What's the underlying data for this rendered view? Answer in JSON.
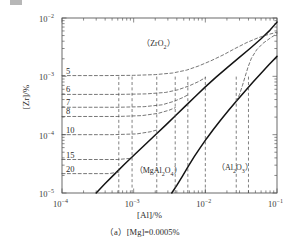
{
  "figure": {
    "caption_prefix": "（a）",
    "caption_text": "[Mg]=0.0005%",
    "caption_full": "（a）[Mg]=0.0005%"
  },
  "chart_data": {
    "type": "line",
    "title": "",
    "xlabel": "[Al]/%",
    "ylabel": "[Zr]/%",
    "xscale": "log",
    "yscale": "log",
    "xlim": [
      0.0001,
      0.1
    ],
    "ylim": [
      1e-05,
      0.01
    ],
    "grid": false,
    "legend_position": "none",
    "xticklabels": [
      "10-4",
      "10-3",
      "10-2",
      "10-1"
    ],
    "xtickvalues": [
      0.0001,
      0.001,
      0.01,
      0.1
    ],
    "yticklabels": [
      "10-2",
      "10-3",
      "10-4",
      "10-5"
    ],
    "ytickvalues": [
      0.01,
      0.001,
      0.0001,
      1e-05
    ],
    "annotations": [
      {
        "name": "region-zro2",
        "text": "（ZrO2）",
        "x": 0.0022,
        "y": 0.0035
      },
      {
        "name": "region-mgal2o4",
        "text": "（MgAl2O4）",
        "x": 0.0022,
        "y": 2.25e-05
      },
      {
        "name": "region-al2o3",
        "text": "（Al2O3）",
        "x": 0.026,
        "y": 2.55e-05
      }
    ],
    "contour_labels": [
      {
        "label": "5",
        "y": 0.00103
      },
      {
        "label": "6",
        "y": 0.00049
      },
      {
        "label": "7",
        "y": 0.000295
      },
      {
        "label": "8",
        "y": 0.000205
      },
      {
        "label": "10",
        "y": 0.0001
      },
      {
        "label": "15",
        "y": 3.75e-05
      },
      {
        "label": "20",
        "y": 2.15e-05
      }
    ],
    "series": [
      {
        "name": "ZrO2 / MgAl2O4 boundary (solid)",
        "style": "solid",
        "points": [
          [
            0.0003,
            1e-05
          ],
          [
            0.0004,
            1.45e-05
          ],
          [
            0.00055,
            2.15e-05
          ],
          [
            0.00075,
            3.15e-05
          ],
          [
            0.00105,
            4.65e-05
          ],
          [
            0.00145,
            6.8e-05
          ],
          [
            0.002,
            9.9e-05
          ],
          [
            0.0028,
            0.000146
          ],
          [
            0.00385,
            0.000213
          ],
          [
            0.0053,
            0.000312
          ],
          [
            0.0073,
            0.000455
          ],
          [
            0.01,
            0.00066
          ],
          [
            0.014,
            0.00096
          ],
          [
            0.02,
            0.0014
          ],
          [
            0.029,
            0.00205
          ],
          [
            0.042,
            0.003
          ],
          [
            0.06,
            0.0044
          ],
          [
            0.08,
            0.0062
          ],
          [
            0.1,
            0.0085
          ]
        ]
      },
      {
        "name": "MgAl2O4 / Al2O3 boundary (solid)",
        "style": "solid",
        "points": [
          [
            0.0034,
            1e-05
          ],
          [
            0.004,
            1.35e-05
          ],
          [
            0.0048,
            1.95e-05
          ],
          [
            0.0058,
            2.9e-05
          ],
          [
            0.007,
            4.2e-05
          ],
          [
            0.0085,
            6e-05
          ],
          [
            0.0105,
            8.7e-05
          ],
          [
            0.013,
            0.000124
          ],
          [
            0.0165,
            0.00018
          ],
          [
            0.021,
            0.00026
          ],
          [
            0.027,
            0.000375
          ],
          [
            0.035,
            0.00054
          ],
          [
            0.046,
            0.00079
          ],
          [
            0.06,
            0.00113
          ],
          [
            0.077,
            0.00158
          ],
          [
            0.1,
            0.0022
          ]
        ]
      },
      {
        "name": "contour-5",
        "style": "dashed",
        "points": [
          [
            0.0001,
            0.00103
          ],
          [
            0.0004,
            0.00103
          ],
          [
            0.001,
            0.00104
          ],
          [
            0.002,
            0.00107
          ],
          [
            0.0035,
            0.00114
          ],
          [
            0.0055,
            0.00128
          ],
          [
            0.008,
            0.0015
          ],
          [
            0.012,
            0.00185
          ],
          [
            0.018,
            0.00235
          ],
          [
            0.026,
            0.003
          ],
          [
            0.038,
            0.0038
          ],
          [
            0.055,
            0.0046
          ],
          [
            0.075,
            0.0052
          ],
          [
            0.1,
            0.0057
          ]
        ]
      },
      {
        "name": "contour-6",
        "style": "dashed",
        "points": [
          [
            0.0001,
            0.00049
          ],
          [
            0.0006,
            0.00049
          ],
          [
            0.0015,
            0.0005
          ],
          [
            0.0028,
            0.00053
          ],
          [
            0.0042,
            0.00059
          ],
          [
            0.006,
            0.00069
          ],
          [
            0.008,
            0.00081
          ],
          [
            0.01,
            0.00095
          ]
        ]
      },
      {
        "name": "contour-7",
        "style": "dashed",
        "points": [
          [
            0.0001,
            0.000295
          ],
          [
            0.0006,
            0.000295
          ],
          [
            0.0014,
            0.000302
          ],
          [
            0.0025,
            0.000325
          ],
          [
            0.0037,
            0.000375
          ],
          [
            0.0048,
            0.00043
          ],
          [
            0.0057,
            0.00048
          ]
        ]
      },
      {
        "name": "contour-8",
        "style": "dashed",
        "points": [
          [
            0.0001,
            0.000205
          ],
          [
            0.0006,
            0.000205
          ],
          [
            0.0013,
            0.000212
          ],
          [
            0.0022,
            0.000232
          ],
          [
            0.0031,
            0.000262
          ],
          [
            0.0038,
            0.00029
          ]
        ]
      },
      {
        "name": "contour-10",
        "style": "dashed",
        "points": [
          [
            0.0001,
            0.0001
          ],
          [
            0.0005,
            0.0001
          ],
          [
            0.0011,
            0.000103
          ],
          [
            0.0017,
            0.000112
          ],
          [
            0.0021,
            0.00012
          ]
        ]
      },
      {
        "name": "contour-15",
        "style": "dashed",
        "points": [
          [
            0.0001,
            3.75e-05
          ],
          [
            0.0006,
            3.75e-05
          ],
          [
            0.00095,
            3.95e-05
          ]
        ]
      },
      {
        "name": "contour-20",
        "style": "dashed",
        "points": [
          [
            0.0001,
            2.15e-05
          ],
          [
            0.00045,
            2.15e-05
          ],
          [
            0.00062,
            2.28e-05
          ]
        ]
      },
      {
        "name": "al2o3-dashed-branch",
        "style": "dashed",
        "points": [
          [
            0.027,
            0.000375
          ],
          [
            0.03,
            0.00049
          ],
          [
            0.033,
            0.0007
          ],
          [
            0.036,
            0.001
          ],
          [
            0.0395,
            0.00145
          ],
          [
            0.044,
            0.00205
          ],
          [
            0.052,
            0.00285
          ],
          [
            0.064,
            0.0037
          ],
          [
            0.08,
            0.0045
          ],
          [
            0.1,
            0.0054
          ]
        ]
      }
    ],
    "droplines": [
      {
        "name": "dropline-20",
        "x": 0.00062
      },
      {
        "name": "dropline-15",
        "x": 0.00095
      },
      {
        "name": "dropline-10",
        "x": 0.0021
      },
      {
        "name": "dropline-8",
        "x": 0.0038
      },
      {
        "name": "dropline-7",
        "x": 0.0057
      },
      {
        "name": "dropline-6",
        "x": 0.01
      },
      {
        "name": "dropline-5",
        "x": 0.027
      },
      {
        "name": "dropline-al2o3",
        "x": 0.04
      }
    ]
  }
}
